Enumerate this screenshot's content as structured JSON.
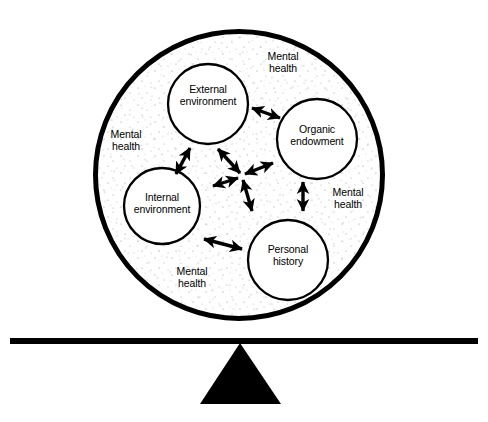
{
  "diagram": {
    "colors": {
      "ink": "#000000",
      "background": "#ffffff",
      "stipple": "#8a8a8a"
    },
    "outer_circle": {
      "name": "mental-health-sphere",
      "cx": 239,
      "cy": 175,
      "r": 146,
      "stroke_width": 5,
      "fill_pattern": "stipple-dots"
    },
    "nodes": [
      {
        "id": "external-environment",
        "label": "External\nenvironment",
        "cx": 208,
        "cy": 104,
        "r": 40
      },
      {
        "id": "organic-endowment",
        "label": "Organic\nendowment",
        "cx": 317,
        "cy": 139,
        "r": 40
      },
      {
        "id": "internal-environment",
        "label": "Internal\nenvironment",
        "cx": 162,
        "cy": 206,
        "r": 38
      },
      {
        "id": "personal-history",
        "label": "Personal\nhistory",
        "cx": 288,
        "cy": 260,
        "r": 40
      }
    ],
    "ring_labels": [
      {
        "id": "mental-health-top",
        "label": "Mental\nhealth",
        "x": 283,
        "y": 63
      },
      {
        "id": "mental-health-left",
        "label": "Mental\nhealth",
        "x": 126,
        "y": 141
      },
      {
        "id": "mental-health-right",
        "label": "Mental\nhealth",
        "x": 348,
        "y": 199
      },
      {
        "id": "mental-health-bottom",
        "label": "Mental\nhealth",
        "x": 192,
        "y": 278
      }
    ],
    "connector_arrows": [
      {
        "id": "arrow-external-to-organic",
        "x1": 251,
        "y1": 108,
        "x2": 281,
        "y2": 118,
        "double_headed": true
      },
      {
        "id": "arrow-external-to-internal",
        "x1": 190,
        "y1": 148,
        "x2": 175,
        "y2": 175,
        "double_headed": true
      },
      {
        "id": "arrow-organic-to-personal",
        "x1": 303,
        "y1": 181,
        "x2": 303,
        "y2": 212,
        "double_headed": true
      },
      {
        "id": "arrow-internal-to-personal",
        "x1": 203,
        "y1": 239,
        "x2": 243,
        "y2": 249,
        "double_headed": true
      }
    ],
    "hub_arrows": {
      "id": "central-interaction-hub",
      "cx": 244,
      "cy": 177,
      "spokes": [
        {
          "id": "hub-spoke-upper-left",
          "x": 217,
          "y": 147
        },
        {
          "id": "hub-spoke-upper-right",
          "x": 275,
          "y": 162
        },
        {
          "id": "hub-spoke-lower-left",
          "x": 211,
          "y": 185
        },
        {
          "id": "hub-spoke-lower-right",
          "x": 253,
          "y": 213
        }
      ],
      "double_headed": true
    },
    "balance": {
      "beam": {
        "id": "balance-beam",
        "x1": 10,
        "y1": 341,
        "x2": 478,
        "y2": 341,
        "thickness": 6
      },
      "fulcrum": {
        "id": "balance-fulcrum",
        "apex_x": 240,
        "apex_y": 343,
        "left_x": 200,
        "right_x": 281,
        "base_y": 404
      }
    }
  }
}
